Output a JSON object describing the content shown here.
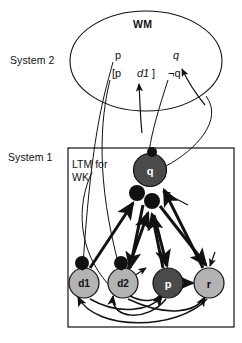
{
  "figure": {
    "title": "WM",
    "system2_label": "System 2",
    "system1_label": "System 1",
    "ltm_label": "LTM for\nWK"
  },
  "wm_contents": [
    {
      "id": "p",
      "text": "p",
      "x": 115,
      "y": 55,
      "italic": false
    },
    {
      "id": "q",
      "text": "q",
      "x": 173,
      "y": 55,
      "italic": true
    },
    {
      "id": "bracket1",
      "text": "[p",
      "x": 112,
      "y": 73,
      "italic": false
    },
    {
      "id": "d1",
      "text": "d1",
      "x": 137,
      "y": 73,
      "italic": true
    },
    {
      "id": "bracket2",
      "text": "]",
      "x": 152,
      "y": 73,
      "italic": false
    },
    {
      "id": "notq",
      "text": "¬q",
      "x": 170,
      "y": 73,
      "italic": false
    }
  ],
  "ellipse": {
    "cx": 146,
    "cy": 61,
    "rx": 76,
    "ry": 50
  },
  "system1_box": {
    "x": 68,
    "y": 148,
    "w": 166,
    "h": 179
  },
  "nodes": [
    {
      "id": "q",
      "label": "q",
      "cx": 150,
      "cy": 170,
      "r": 16.5,
      "fill": "#4a4a4a",
      "text_color": "#ffffff"
    },
    {
      "id": "d1",
      "label": "d1",
      "cx": 84,
      "cy": 283,
      "r": 15,
      "fill": "#b3b3b3",
      "text_color": "#111111"
    },
    {
      "id": "d2",
      "label": "d2",
      "cx": 123,
      "cy": 283,
      "r": 15,
      "fill": "#b3b3b3",
      "text_color": "#111111"
    },
    {
      "id": "p",
      "label": "p",
      "cx": 168,
      "cy": 283,
      "r": 15,
      "fill": "#4a4a4a",
      "text_color": "#ffffff"
    },
    {
      "id": "r",
      "label": "r",
      "cx": 209,
      "cy": 283,
      "r": 15,
      "fill": "#b3b3b3",
      "text_color": "#111111"
    }
  ],
  "inhibitory_dots": [
    {
      "id": "dot-q-top",
      "cx": 152,
      "cy": 152,
      "r": 5
    },
    {
      "id": "dot-q-left",
      "cx": 137,
      "cy": 193,
      "r": 8
    },
    {
      "id": "dot-q-mid",
      "cx": 152,
      "cy": 201,
      "r": 8
    },
    {
      "id": "dot-d1",
      "cx": 82,
      "cy": 263,
      "r": 7
    },
    {
      "id": "dot-d2",
      "cx": 121,
      "cy": 263,
      "r": 7
    }
  ],
  "colors": {
    "stroke": "#111111",
    "node_light": "#b3b3b3",
    "node_dark": "#4a4a4a",
    "background": "#ffffff"
  }
}
